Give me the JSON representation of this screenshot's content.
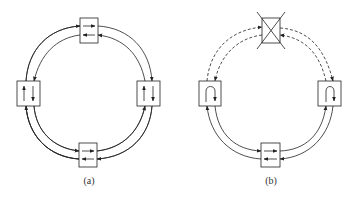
{
  "figure": {
    "panels": [
      {
        "id": "a",
        "label": "(a)",
        "description": "Ring of four nodes with bidirectional links (dual counter-rotating ring)",
        "nodes": [
          "top",
          "right",
          "bottom",
          "left"
        ],
        "links": "all solid, two directions"
      },
      {
        "id": "b",
        "label": "(b)",
        "description": "Ring after top node failure; adjacent nodes loop back traffic (wrap)",
        "nodes": [
          "top (failed, crossed out)",
          "right (loopback)",
          "bottom",
          "left (loopback)"
        ],
        "links": "links to failed node dashed"
      }
    ],
    "colors": {
      "line": "#222222",
      "background": "#ffffff"
    }
  }
}
